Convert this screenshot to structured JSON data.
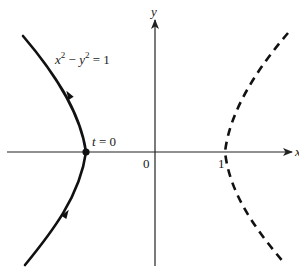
{
  "diagram": {
    "equation": {
      "lhs_x": "x",
      "exp1": "2",
      "minus": " − ",
      "lhs_y": "y",
      "exp2": "2",
      "rhs": " = 1"
    },
    "point_label": {
      "var": "t",
      "rest": " = 0"
    },
    "axes": {
      "x_label": "x",
      "y_label": "y",
      "origin_label": "0",
      "tick_one_label": "1"
    },
    "branches": [
      {
        "name": "left-branch",
        "style": "solid",
        "direction": "upward",
        "vertex": [
          -1,
          0
        ]
      },
      {
        "name": "right-branch",
        "style": "dashed",
        "vertex": [
          1,
          0
        ]
      }
    ],
    "colors": {
      "curve": "#111111",
      "axis": "#222222",
      "background": "#ffffff"
    }
  }
}
